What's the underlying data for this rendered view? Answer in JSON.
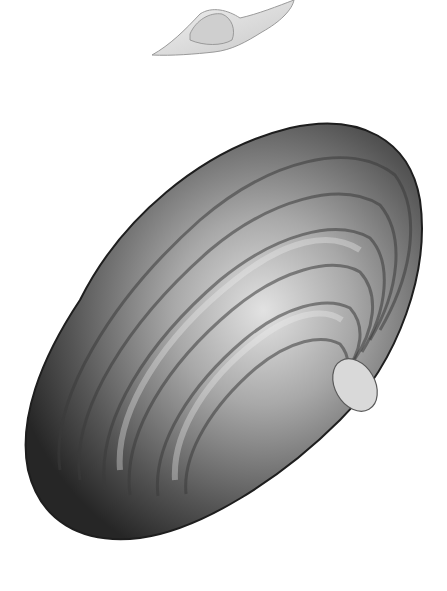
{
  "image": {
    "subject": "engraved illustration of a bivalve shell",
    "background_color": "#ffffff",
    "figures": [
      {
        "name": "shell-profile-view",
        "description": "small side profile of the shell near top center",
        "tone": "light gray"
      },
      {
        "name": "shell-main-view",
        "description": "large oblong shell valve with concentric growth rings, tilted diagonally",
        "tone": "gray to near-black shading"
      }
    ],
    "colors": {
      "shell_dark": "#2e2e2e",
      "shell_mid": "#7a7a7a",
      "shell_light": "#d6d6d6",
      "profile_light": "#e4e4e4",
      "profile_edge": "#9a9a9a"
    }
  }
}
